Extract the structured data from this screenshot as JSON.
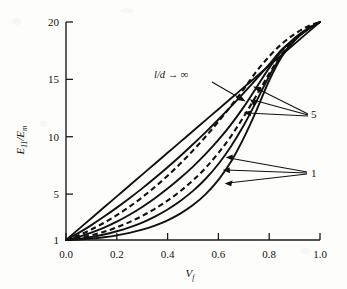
{
  "figure": {
    "background_color": "#fdfdfb",
    "line_color": "#111111"
  },
  "axes": {
    "x": {
      "title": "V",
      "title_sub": "f",
      "tick_labels": [
        "0.0",
        "0.2",
        "0.4",
        "0.6",
        "0.8",
        "1.0"
      ],
      "tick_values": [
        0.0,
        0.2,
        0.4,
        0.6,
        0.8,
        1.0
      ],
      "range": [
        0.0,
        1.0
      ]
    },
    "y": {
      "title_num": "E",
      "title_num_sub": "11",
      "title_sep": "/",
      "title_den": "E",
      "title_den_sub": "m",
      "tick_labels": [
        "1",
        "5",
        "10",
        "15",
        "20"
      ],
      "tick_values": [
        1,
        5,
        10,
        15,
        20
      ],
      "range": [
        1,
        20
      ]
    }
  },
  "annotations": [
    {
      "name": "aspect-ratio-infinity",
      "text": "l/d → ∞",
      "x": 0.345,
      "y": 15.35
    },
    {
      "name": "aspect-ratio-5",
      "text": "5",
      "x": 1.045,
      "y": 12.45
    },
    {
      "name": "aspect-ratio-1",
      "text": "1",
      "x": 1.045,
      "y": 5.25
    }
  ],
  "chart_data": {
    "type": "line",
    "title": "",
    "xlabel": "V_f",
    "ylabel": "E_11/E_m",
    "xlim": [
      0.0,
      1.0
    ],
    "ylim": [
      1,
      20
    ],
    "grid": false,
    "legend": "none (curves annotated in-plot)",
    "x": [
      0.0,
      0.05,
      0.1,
      0.15,
      0.2,
      0.25,
      0.3,
      0.35,
      0.4,
      0.45,
      0.5,
      0.55,
      0.6,
      0.65,
      0.7,
      0.75,
      0.8,
      0.85,
      0.9,
      0.95,
      1.0
    ],
    "series": [
      {
        "name": "l/d → ∞",
        "style": "solid",
        "annotation": "l/d → ∞",
        "values": [
          1.0,
          1.95,
          2.9,
          3.85,
          4.8,
          5.75,
          6.7,
          7.65,
          8.6,
          9.55,
          10.5,
          11.45,
          12.4,
          13.35,
          14.3,
          15.25,
          16.2,
          17.15,
          18.1,
          19.05,
          20.0
        ]
      },
      {
        "name": "l/d = 100",
        "style": "solid",
        "annotation": "",
        "values": [
          1.0,
          1.62,
          2.3,
          3.04,
          3.82,
          4.64,
          5.5,
          6.4,
          7.34,
          8.32,
          9.34,
          10.4,
          11.5,
          12.64,
          13.82,
          15.04,
          16.3,
          17.6,
          18.5,
          19.3,
          20.0
        ]
      },
      {
        "name": "l/d = 50",
        "style": "dashed",
        "annotation": "",
        "values": [
          1.0,
          1.42,
          1.92,
          2.5,
          3.16,
          3.9,
          4.72,
          5.62,
          6.6,
          7.66,
          8.8,
          10.02,
          11.32,
          12.7,
          14.16,
          15.7,
          17.0,
          18.1,
          18.95,
          19.6,
          20.0
        ]
      },
      {
        "name": "l/d = 20",
        "style": "solid",
        "annotation": "5",
        "values": [
          1.0,
          1.28,
          1.64,
          2.08,
          2.6,
          3.2,
          3.88,
          4.64,
          5.48,
          6.4,
          7.4,
          8.5,
          9.72,
          11.08,
          12.6,
          14.3,
          16.0,
          17.5,
          18.6,
          19.4,
          20.0
        ]
      },
      {
        "name": "l/d = 10",
        "style": "dashed",
        "annotation": "5",
        "values": [
          1.0,
          1.18,
          1.42,
          1.72,
          2.1,
          2.56,
          3.1,
          3.72,
          4.44,
          5.26,
          6.2,
          7.3,
          8.58,
          10.06,
          11.76,
          13.6,
          15.5,
          17.2,
          18.5,
          19.4,
          20.0
        ]
      },
      {
        "name": "l/d = 5",
        "style": "solid",
        "annotation": "5",
        "values": [
          1.0,
          1.1,
          1.26,
          1.48,
          1.76,
          2.1,
          2.52,
          3.04,
          3.66,
          4.4,
          5.28,
          6.34,
          7.62,
          9.18,
          11.0,
          13.1,
          15.3,
          17.1,
          18.4,
          19.35,
          20.0
        ]
      },
      {
        "name": "l/d = 1",
        "style": "solid",
        "annotation": "1",
        "values": [
          1.0,
          1.04,
          1.12,
          1.24,
          1.4,
          1.62,
          1.9,
          2.26,
          2.72,
          3.3,
          4.04,
          5.0,
          6.24,
          7.84,
          9.9,
          12.3,
          14.9,
          17.0,
          18.4,
          19.35,
          20.0
        ]
      }
    ]
  }
}
